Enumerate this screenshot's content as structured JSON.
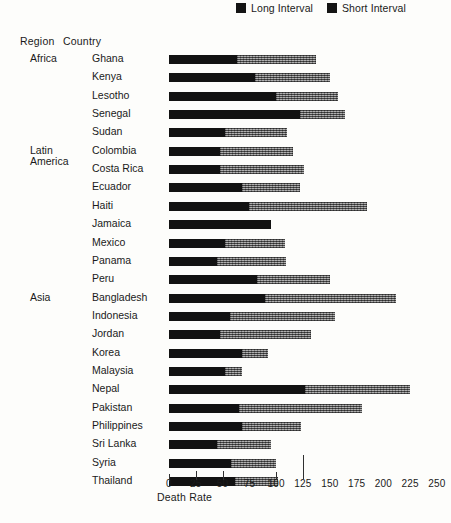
{
  "legend": {
    "items": [
      {
        "label": "Long Interval",
        "icon": "square-swatch",
        "color": "#121212"
      },
      {
        "label": "Short Interval",
        "icon": "square-swatch",
        "color": "#8f8f8f"
      }
    ]
  },
  "columns": {
    "region_header": "Region",
    "country_header": "Country"
  },
  "axis": {
    "title": "Death Rate",
    "ticks": [
      0,
      25,
      50,
      75,
      100,
      125,
      150,
      175,
      200,
      225,
      250
    ],
    "min": 0,
    "max": 250
  },
  "chart_data": {
    "type": "bar",
    "orientation": "horizontal",
    "title": "",
    "xlabel": "Death Rate",
    "ylabel": "",
    "xlim": [
      0,
      250
    ],
    "grid": false,
    "stacked": true,
    "legend_position": "top-right",
    "categories": [
      "Ghana",
      "Kenya",
      "Lesotho",
      "Senegal",
      "Sudan",
      "Colombia",
      "Costa Rica",
      "Ecuador",
      "Haiti",
      "Jamaica",
      "Mexico",
      "Panama",
      "Peru",
      "Bangladesh",
      "Indonesia",
      "Jordan",
      "Korea",
      "Malaysia",
      "Nepal",
      "Pakistan",
      "Philippines",
      "Sri Lanka",
      "Syria",
      "Thailand"
    ],
    "groups": [
      {
        "region": "Africa",
        "countries": [
          "Ghana",
          "Kenya",
          "Lesotho",
          "Senegal",
          "Sudan"
        ]
      },
      {
        "region": "Latin America",
        "countries": [
          "Colombia",
          "Costa Rica",
          "Ecuador",
          "Haiti",
          "Jamaica",
          "Mexico",
          "Panama",
          "Peru"
        ]
      },
      {
        "region": "Asia",
        "countries": [
          "Bangladesh",
          "Indonesia",
          "Jordan",
          "Korea",
          "Malaysia",
          "Nepal",
          "Pakistan",
          "Philippines",
          "Sri Lanka",
          "Syria",
          "Thailand"
        ]
      }
    ],
    "series": [
      {
        "name": "Long Interval",
        "values": [
          63,
          80,
          100,
          122,
          52,
          48,
          48,
          68,
          75,
          95,
          52,
          45,
          82,
          90,
          57,
          48,
          68,
          52,
          127,
          65,
          68,
          45,
          58,
          62
        ]
      },
      {
        "name": "Short Interval",
        "values": [
          74,
          70,
          58,
          42,
          58,
          68,
          78,
          54,
          110,
          0,
          56,
          64,
          68,
          122,
          98,
          84,
          24,
          16,
          98,
          115,
          55,
          50,
          42,
          40
        ]
      }
    ],
    "totals": [
      137,
      150,
      158,
      164,
      110,
      116,
      126,
      122,
      185,
      95,
      108,
      109,
      150,
      212,
      155,
      132,
      92,
      68,
      225,
      180,
      123,
      95,
      100,
      102
    ],
    "rows": [
      {
        "region": "Africa",
        "country": "Ghana",
        "long": 63,
        "short": 74,
        "total": 137
      },
      {
        "region": "",
        "country": "Kenya",
        "long": 80,
        "short": 70,
        "total": 150
      },
      {
        "region": "",
        "country": "Lesotho",
        "long": 100,
        "short": 58,
        "total": 158
      },
      {
        "region": "",
        "country": "Senegal",
        "long": 122,
        "short": 42,
        "total": 164
      },
      {
        "region": "",
        "country": "Sudan",
        "long": 52,
        "short": 58,
        "total": 110
      },
      {
        "region": "Latin America",
        "country": "Colombia",
        "long": 48,
        "short": 68,
        "total": 116
      },
      {
        "region": "",
        "country": "Costa Rica",
        "long": 48,
        "short": 78,
        "total": 126
      },
      {
        "region": "",
        "country": "Ecuador",
        "long": 68,
        "short": 54,
        "total": 122
      },
      {
        "region": "",
        "country": "Haiti",
        "long": 75,
        "short": 110,
        "total": 185
      },
      {
        "region": "",
        "country": "Jamaica",
        "long": 95,
        "short": 0,
        "total": 95
      },
      {
        "region": "",
        "country": "Mexico",
        "long": 52,
        "short": 56,
        "total": 108
      },
      {
        "region": "",
        "country": "Panama",
        "long": 45,
        "short": 64,
        "total": 109
      },
      {
        "region": "",
        "country": "Peru",
        "long": 82,
        "short": 68,
        "total": 150
      },
      {
        "region": "Asia",
        "country": "Bangladesh",
        "long": 90,
        "short": 122,
        "total": 212
      },
      {
        "region": "",
        "country": "Indonesia",
        "long": 57,
        "short": 98,
        "total": 155
      },
      {
        "region": "",
        "country": "Jordan",
        "long": 48,
        "short": 84,
        "total": 132
      },
      {
        "region": "",
        "country": "Korea",
        "long": 68,
        "short": 24,
        "total": 92
      },
      {
        "region": "",
        "country": "Malaysia",
        "long": 52,
        "short": 16,
        "total": 68
      },
      {
        "region": "",
        "country": "Nepal",
        "long": 127,
        "short": 98,
        "total": 225
      },
      {
        "region": "",
        "country": "Pakistan",
        "long": 65,
        "short": 115,
        "total": 180
      },
      {
        "region": "",
        "country": "Philippines",
        "long": 68,
        "short": 55,
        "total": 123
      },
      {
        "region": "",
        "country": "Sri Lanka",
        "long": 45,
        "short": 50,
        "total": 95
      },
      {
        "region": "",
        "country": "Syria",
        "long": 58,
        "short": 42,
        "total": 100
      },
      {
        "region": "",
        "country": "Thailand",
        "long": 62,
        "short": 40,
        "total": 102
      }
    ]
  }
}
